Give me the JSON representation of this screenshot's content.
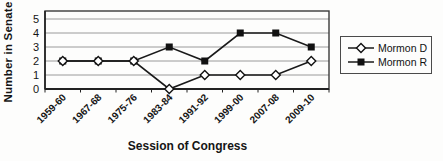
{
  "chart_data": {
    "type": "line",
    "title": "",
    "xlabel": "Session of Congress",
    "ylabel": "Number in Senate",
    "categories": [
      "1959-60",
      "1967-68",
      "1975-76",
      "1983-84",
      "1991-92",
      "1999-00",
      "2007-08",
      "2009-10"
    ],
    "series": [
      {
        "name": "Mormon D",
        "marker": "open-diamond",
        "values": [
          2,
          2,
          2,
          0,
          1,
          1,
          1,
          2
        ]
      },
      {
        "name": "Mormon R",
        "marker": "filled-square",
        "values": [
          2,
          2,
          2,
          3,
          2,
          4,
          4,
          3
        ]
      }
    ],
    "ylim": [
      0,
      5
    ],
    "yticks": [
      0,
      1,
      2,
      3,
      4,
      5
    ],
    "grid": true,
    "legend_position": "right"
  },
  "colors": {
    "line": "#1a1a1a",
    "marker_fill": "#111111",
    "marker_open_fill": "#ffffff",
    "grid": "#9a9a9a",
    "frame": "#3a3a3a",
    "axis": "#222222",
    "text": "#151515",
    "background": "#fdfdfc",
    "legend_border": "#4a4a4a"
  }
}
